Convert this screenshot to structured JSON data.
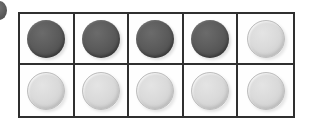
{
  "figure": {
    "edge_marker": {
      "name": "cropped-circle-marker",
      "color": "#4a4a4a",
      "visible": true
    },
    "colors": {
      "dark_coin": "#5c5c5c",
      "light_coin": "#d5d5d5",
      "grid_line": "#2f2f2f",
      "background": "#ffffff"
    }
  },
  "grid": {
    "columns": 5,
    "rows": 2,
    "rows_data": [
      {
        "row_label": "row-1",
        "cells": [
          {
            "cell_label": "r1c1",
            "state": "dark"
          },
          {
            "cell_label": "r1c2",
            "state": "dark"
          },
          {
            "cell_label": "r1c3",
            "state": "dark"
          },
          {
            "cell_label": "r1c4",
            "state": "dark"
          },
          {
            "cell_label": "r1c5",
            "state": "light"
          }
        ]
      },
      {
        "row_label": "row-2",
        "cells": [
          {
            "cell_label": "r2c1",
            "state": "light"
          },
          {
            "cell_label": "r2c2",
            "state": "light"
          },
          {
            "cell_label": "r2c3",
            "state": "light"
          },
          {
            "cell_label": "r2c4",
            "state": "light"
          },
          {
            "cell_label": "r2c5",
            "state": "light"
          }
        ]
      }
    ],
    "counts": {
      "dark_total": 4,
      "light_total": 6,
      "total": 10
    }
  }
}
